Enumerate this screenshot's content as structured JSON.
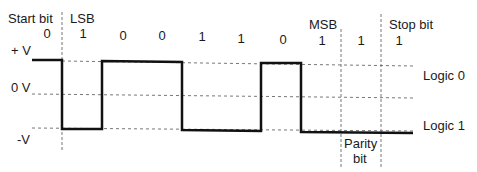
{
  "diagram": {
    "type": "serial-data-frame-waveform",
    "headers": {
      "start_bit": "Start bit",
      "lsb": "LSB",
      "msb": "MSB",
      "stop_bit": "Stop bit"
    },
    "voltage_labels": {
      "plus_v": "+ V",
      "zero_v": "0 V",
      "minus_v": "-V"
    },
    "logic_labels": {
      "logic0": "Logic 0",
      "logic1": "Logic 1"
    },
    "parity_label": {
      "line1": "Parity",
      "line2": "bit"
    },
    "bits": [
      "0",
      "1",
      "0",
      "0",
      "1",
      "1",
      "0",
      "1",
      "1",
      "1"
    ],
    "colors": {
      "waveform": "#111111",
      "dashed": "#777777",
      "text": "#1a1a1a"
    }
  }
}
